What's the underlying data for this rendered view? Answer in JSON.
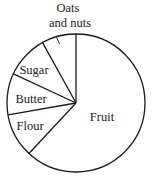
{
  "chart_data": {
    "type": "pie",
    "title": "",
    "start_angle_deg": 0,
    "direction": "counterclockwise",
    "legend": "none (labels inside/next to slices)",
    "categories": [
      "Oats and nuts",
      "Sugar",
      "Butter",
      "Flour",
      "Fruit"
    ],
    "values": [
      8,
      10,
      10,
      10,
      62
    ],
    "unit": "percent (estimated from slice angles)",
    "slice_angles_deg": [
      29,
      36,
      35,
      37,
      223
    ]
  },
  "style": {
    "stroke": "#1a1a1a",
    "fill": "#ffffff",
    "text": "#222222"
  },
  "geometry": {
    "cx": 76,
    "cy": 103,
    "r": 69,
    "boundaries_deg_ccw_from_top": [
      0,
      29,
      65,
      100,
      137
    ]
  },
  "labels": {
    "oats_line1": "Oats",
    "oats_line2": "and nuts",
    "sugar": "Sugar",
    "butter": "Butter",
    "flour": "Flour",
    "fruit": "Fruit"
  }
}
